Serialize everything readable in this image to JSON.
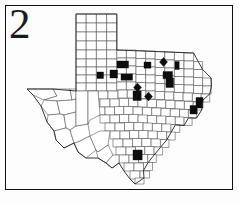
{
  "figure": {
    "panel_label": "2",
    "frame_color": "#101010",
    "background_color": "#ffffff"
  },
  "map": {
    "title": "Texas",
    "subject": "county-level distribution map",
    "county_fill_color": "#ffffff",
    "county_border_color": "#4a4a4a",
    "shaded_fill_color": "#0d0d0d",
    "state_outline_color": "#2b2b2b",
    "total_shaded_counties": 18,
    "shaded_regions": [
      {
        "id": "nc-1",
        "region": "North Central",
        "x": 117,
        "y": 61,
        "w": 11,
        "h": 7,
        "shape": "rect"
      },
      {
        "id": "nc-2",
        "region": "North Central",
        "x": 144,
        "y": 62,
        "w": 7,
        "h": 6,
        "shape": "rect"
      },
      {
        "id": "nc-3",
        "region": "North Central",
        "x": 160,
        "y": 58,
        "w": 7,
        "h": 8,
        "shape": "diamond"
      },
      {
        "id": "nc-4",
        "region": "North Central",
        "x": 175,
        "y": 62,
        "w": 4,
        "h": 8,
        "shape": "rect"
      },
      {
        "id": "c-1",
        "region": "Central",
        "x": 97,
        "y": 72,
        "w": 6,
        "h": 6,
        "shape": "rect"
      },
      {
        "id": "c-2",
        "region": "Central",
        "x": 110,
        "y": 70,
        "w": 7,
        "h": 8,
        "shape": "rect"
      },
      {
        "id": "c-3",
        "region": "Central",
        "x": 121,
        "y": 74,
        "w": 11,
        "h": 6,
        "shape": "rect"
      },
      {
        "id": "c-4",
        "region": "Central",
        "x": 163,
        "y": 72,
        "w": 9,
        "h": 7,
        "shape": "rect"
      },
      {
        "id": "c-5",
        "region": "Central",
        "x": 166,
        "y": 78,
        "w": 7,
        "h": 9,
        "shape": "rect"
      },
      {
        "id": "c-6",
        "region": "Central",
        "x": 134,
        "y": 84,
        "w": 7,
        "h": 7,
        "shape": "diamond"
      },
      {
        "id": "c-7",
        "region": "Central",
        "x": 133,
        "y": 91,
        "w": 8,
        "h": 9,
        "shape": "rect"
      },
      {
        "id": "c-8",
        "region": "Central",
        "x": 145,
        "y": 93,
        "w": 7,
        "h": 7,
        "shape": "diamond"
      },
      {
        "id": "e-1",
        "region": "East Texas",
        "x": 196,
        "y": 98,
        "w": 7,
        "h": 10,
        "shape": "rect"
      },
      {
        "id": "e-2",
        "region": "East Texas",
        "x": 190,
        "y": 106,
        "w": 7,
        "h": 8,
        "shape": "rect"
      },
      {
        "id": "s-1",
        "region": "South Texas",
        "x": 133,
        "y": 150,
        "w": 9,
        "h": 10,
        "shape": "rect"
      }
    ]
  },
  "legend": {
    "shaded_meaning": "county with recorded occurrence",
    "unshaded_meaning": "county without recorded occurrence"
  }
}
